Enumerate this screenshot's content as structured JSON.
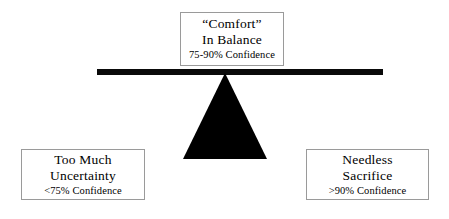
{
  "diagram": {
    "type": "balance-scale",
    "background_color": "#ffffff",
    "ink_color": "#000000",
    "box_border_color": "#9a9a9a",
    "beam": {
      "name": "balance-beam",
      "color": "#0a0a0a"
    },
    "fulcrum": {
      "name": "fulcrum-triangle",
      "color": "#000000"
    },
    "boxes": {
      "top": {
        "line1": "“Comfort”",
        "line2": "In Balance",
        "line3": "75-90% Confidence"
      },
      "left": {
        "line1": "Too Much",
        "line2": "Uncertainty",
        "line3": "<75% Confidence"
      },
      "right": {
        "line1": "Needless",
        "line2": "Sacrifice",
        "line3": ">90% Confidence"
      }
    }
  }
}
